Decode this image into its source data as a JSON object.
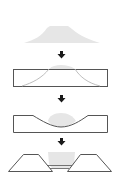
{
  "diagram": {
    "type": "process-flow",
    "orientation": "vertical",
    "steps": [
      {
        "id": "step-1",
        "description": "light gray mound (trapezoidal pile)"
      },
      {
        "id": "step-2",
        "description": "rectangular block containing mound outline"
      },
      {
        "id": "step-3",
        "description": "block with curved depression holding gray fill"
      },
      {
        "id": "step-4",
        "description": "two trapezoids separated by channel with gray fill between"
      }
    ],
    "arrows": 3
  },
  "colors": {
    "background": "#ffffff",
    "mound_fill": "#e6e6e6",
    "outline": "#555555",
    "faint_outline": "#b5b5b5",
    "arrow": "#1a1a1a"
  }
}
